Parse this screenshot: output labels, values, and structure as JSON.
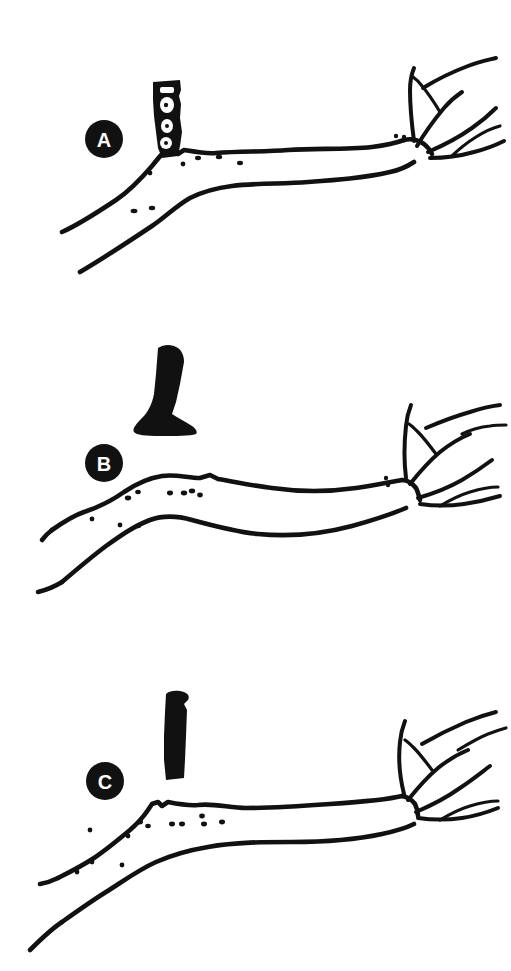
{
  "figure": {
    "background_color": "#ffffff",
    "ink_color": "#111111",
    "panel_count": 3,
    "orientation": "portrait",
    "width_px": 511,
    "height_px": 971
  },
  "panels": [
    {
      "id": "panel-a",
      "label": "A",
      "label_style": "white letter on filled black circle",
      "label_center": {
        "x": 104,
        "y": 139
      },
      "label_radius": 19,
      "attached_object": {
        "name": "stub-outline-structure",
        "description": "hollow outlined rectangular stub standing upright on branch",
        "fill": "outline with white interior cells",
        "position": {
          "x": 152,
          "y": 80,
          "width": 28,
          "height": 78
        }
      },
      "branch": {
        "description": "thick branch running from lower-left to upper-right, forking into slender twigs at right",
        "lenticel_specks": 8,
        "twig_count": 5
      }
    },
    {
      "id": "panel-b",
      "label": "B",
      "label_style": "white letter on filled black circle",
      "label_center": {
        "x": 104,
        "y": 463
      },
      "label_radius": 19,
      "attached_object": {
        "name": "solid-black-boot-object",
        "description": "solid black boot/club-shaped detached structure above the branch",
        "fill": "solid black",
        "position": {
          "x": 125,
          "y": 348,
          "width": 58,
          "height": 82
        }
      },
      "branch": {
        "description": "thick branch running left to right with gentle undulation, forking into slender twigs at right",
        "lenticel_specks": 10,
        "twig_count": 5
      }
    },
    {
      "id": "panel-c",
      "label": "C",
      "label_style": "white letter on filled black circle",
      "label_center": {
        "x": 105,
        "y": 781
      },
      "label_radius": 19,
      "attached_object": {
        "name": "solid-black-column-object",
        "description": "narrow solid black upright column-shaped detached structure above the branch",
        "fill": "solid black",
        "position": {
          "x": 163,
          "y": 694,
          "width": 24,
          "height": 78
        }
      },
      "branch": {
        "description": "thick branch with a stepped shoulder at left, running right and forking into slender twigs",
        "lenticel_specks": 12,
        "twig_count": 5
      }
    }
  ],
  "caption": {
    "visible": false,
    "text": ""
  }
}
